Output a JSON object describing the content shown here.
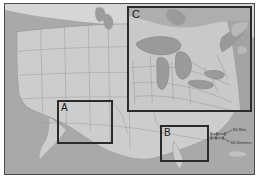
{
  "figure": {
    "type": "reference-map",
    "title": "",
    "projection_note": "",
    "background_color": "#a9a9a9",
    "land_color": "#cdcdcd",
    "border_color": "#4a4a4a",
    "highlight_color": "#2b2b2b"
  },
  "basemap": {
    "name": "contiguous-united-states",
    "features": [
      "state-boundaries",
      "coastline",
      "great-lakes"
    ],
    "ocean_label": "",
    "land_label": ""
  },
  "study_areas": [
    {
      "id": "A",
      "label": "A",
      "region": "southwest-four-corners",
      "x": 52,
      "y": 96,
      "w": 56,
      "h": 44
    },
    {
      "id": "B",
      "label": "B",
      "region": "florida-gulf-coast",
      "x": 155,
      "y": 121,
      "w": 49,
      "h": 37
    },
    {
      "id": "C",
      "label": "C",
      "region": "great-lakes-northeast",
      "x": 122,
      "y": 2,
      "w": 125,
      "h": 106
    }
  ],
  "scale_bar": {
    "miles": {
      "label": "300 Miles",
      "value": 300,
      "unit": "Miles"
    },
    "kilometers": {
      "label": "300 Kilometers",
      "value": 300,
      "unit": "Kilometers"
    },
    "zero_tick": "0"
  }
}
